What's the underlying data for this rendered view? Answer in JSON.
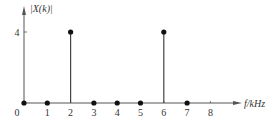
{
  "chart_data": {
    "type": "stem",
    "title": "",
    "xlabel": "f/kHz",
    "ylabel": "|X(k)|",
    "x": [
      0,
      1,
      2,
      3,
      4,
      5,
      6,
      7
    ],
    "values": [
      0,
      0,
      4,
      0,
      0,
      0,
      4,
      0
    ],
    "x_ticks": [
      0,
      1,
      2,
      3,
      4,
      5,
      6,
      7,
      8
    ],
    "y_ticks": [
      4
    ],
    "xlim": [
      0,
      9
    ],
    "ylim": [
      0,
      5
    ],
    "grid": false,
    "legend": null
  },
  "colors": {
    "axis": "#555555",
    "stem": "#444444",
    "marker": "#111111",
    "text": "#333333"
  }
}
